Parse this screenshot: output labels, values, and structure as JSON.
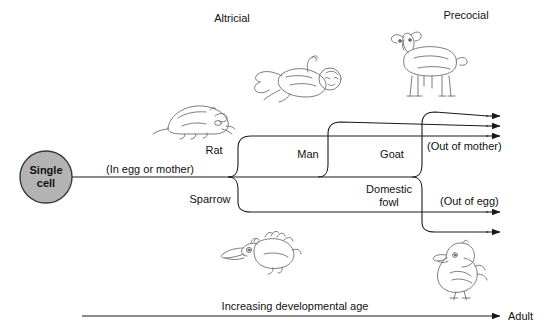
{
  "figure": {
    "type": "developmental-biology-flow-diagram",
    "background_color": "#ffffff",
    "line_color": "#1a1a1a",
    "sketch_color": "#6e6e6e",
    "cell_fill_color": "#b3b3b3"
  },
  "headings": {
    "altricial": "Altricial",
    "precocial": "Precocial"
  },
  "origin": {
    "line1": "Single",
    "line2": "cell"
  },
  "stage_labels": {
    "in_egg_or_mother": "(In egg or mother)",
    "out_of_mother": "(Out of mother)",
    "out_of_egg": "(Out of egg)"
  },
  "species": [
    {
      "id": "rat",
      "label": "Rat",
      "group": "altricial",
      "birth_mode": "out-of-mother"
    },
    {
      "id": "man",
      "label": "Man",
      "group": "altricial",
      "birth_mode": "out-of-mother"
    },
    {
      "id": "goat",
      "label": "Goat",
      "group": "precocial",
      "birth_mode": "out-of-mother"
    },
    {
      "id": "sparrow",
      "label": "Sparrow",
      "group": "altricial",
      "birth_mode": "out-of-egg"
    },
    {
      "id": "domestic_fowl",
      "label": "Domestic\nfowl",
      "label_line1": "Domestic",
      "label_line2": "fowl",
      "group": "precocial",
      "birth_mode": "out-of-egg"
    }
  ],
  "axis": {
    "caption": "Increasing developmental age",
    "end_label": "Adult"
  },
  "illustrations": [
    {
      "id": "rat-sketch",
      "name": "newborn-rat-pup"
    },
    {
      "id": "baby-sketch",
      "name": "human-infant"
    },
    {
      "id": "goat-sketch",
      "name": "goat-kid"
    },
    {
      "id": "sparrow-sketch",
      "name": "sparrow-hatchling"
    },
    {
      "id": "chick-sketch",
      "name": "domestic-fowl-chick"
    }
  ]
}
